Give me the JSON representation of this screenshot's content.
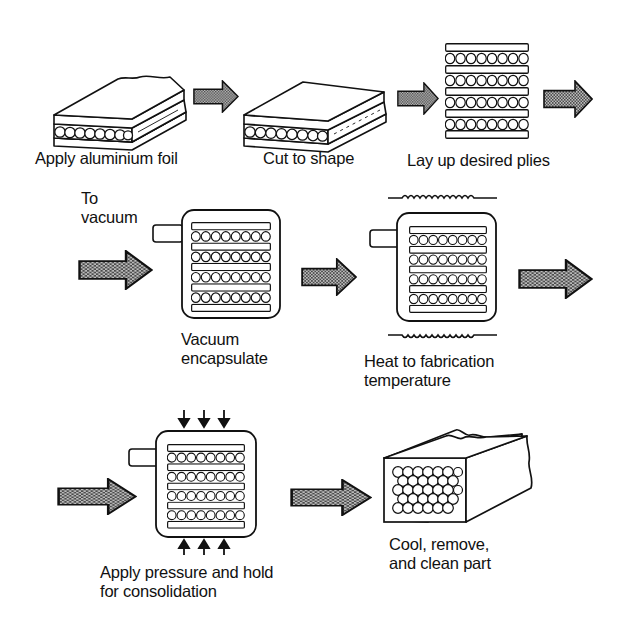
{
  "diagram": {
    "colors": {
      "ink": "#111111",
      "arrow_fill": "#8a8a8a",
      "background": "#ffffff"
    },
    "steps": [
      {
        "id": 1,
        "label": "Apply aluminium foil",
        "lines": [
          "Apply aluminium foil"
        ],
        "icon": "foil-sheet-icon"
      },
      {
        "id": 2,
        "label": "Cut to shape",
        "lines": [
          "Cut to shape"
        ],
        "icon": "cut-sheet-icon"
      },
      {
        "id": 3,
        "label": "Lay up desired plies",
        "lines": [
          "Lay up desired plies"
        ],
        "icon": "ply-stack-icon"
      },
      {
        "id": 4,
        "label": "Vacuum encapsulate",
        "lines": [
          "Vacuum",
          "encapsulate"
        ],
        "icon": "vacuum-container-icon",
        "annotation": [
          "To",
          "vacuum"
        ]
      },
      {
        "id": 5,
        "label": "Heat to fabrication temperature",
        "lines": [
          "Heat to fabrication",
          "temperature"
        ],
        "icon": "heated-container-icon"
      },
      {
        "id": 6,
        "label": "Apply pressure and hold for consolidation",
        "lines": [
          "Apply pressure and hold",
          "for consolidation"
        ],
        "icon": "pressure-container-icon"
      },
      {
        "id": 7,
        "label": "Cool, remove, and clean part",
        "lines": [
          "Cool, remove,",
          "and clean part"
        ],
        "icon": "consolidated-part-icon"
      }
    ],
    "arrows": [
      {
        "from": 1,
        "to": 2
      },
      {
        "from": 2,
        "to": 3
      },
      {
        "from": 3,
        "to": 4
      },
      {
        "from": "row2-start",
        "to": 4
      },
      {
        "from": 4,
        "to": 5
      },
      {
        "from": 5,
        "to": 6
      },
      {
        "from": "row3-start",
        "to": 6
      },
      {
        "from": 6,
        "to": 7
      }
    ]
  }
}
